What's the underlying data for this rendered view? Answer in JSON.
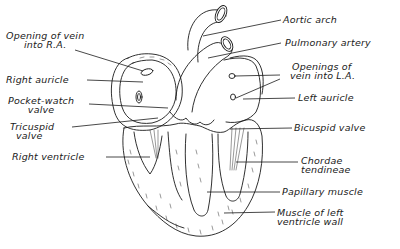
{
  "figure": {
    "line_color": "#1a1a1a",
    "background": "#ffffff"
  },
  "labels": {
    "opening_vein_ra": {
      "line1": "Opening of vein",
      "line2": "into R.A."
    },
    "right_auricle": {
      "text": "Right auricle"
    },
    "pocket_watch_valve": {
      "line1": "Pocket-watch",
      "line2": "valve"
    },
    "tricuspid_valve": {
      "line1": "Tricuspid",
      "line2": "valve"
    },
    "right_ventricle": {
      "text": "Right ventricle"
    },
    "aortic_arch": {
      "text": "Aortic arch"
    },
    "pulmonary_artery": {
      "text": "Pulmonary artery"
    },
    "openings_vein_la": {
      "line1": "Openings of",
      "line2": "vein into L.A."
    },
    "left_auricle": {
      "text": "Left auricle"
    },
    "bicuspid_valve": {
      "text": "Bicuspid valve"
    },
    "chordae_tendineae": {
      "line1": "Chordae",
      "line2": "tendineae"
    },
    "papillary_muscle": {
      "text": "Papillary muscle"
    },
    "muscle_left_ventricle": {
      "line1": "Muscle of left",
      "line2": "ventricle wall"
    }
  }
}
